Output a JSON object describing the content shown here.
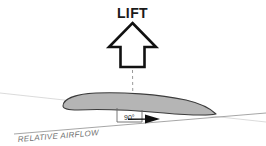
{
  "diagram": {
    "background_color": "#ffffff",
    "width": 266,
    "height": 146
  },
  "labels": {
    "lift": "LIFT",
    "angle": "90°",
    "relative_airflow": "RELATIVE AIRFLOW"
  },
  "colors": {
    "outline": "#111111",
    "airfoil_fill": "#b5b5b5",
    "airfoil_stroke": "#3a3a3a",
    "chord_line": "#cccccc",
    "airflow_line": "#8a8a8a",
    "dashed_line": "#9a9a9a",
    "angle_box": "#6a6a6a",
    "text_dark": "#1a1a1a",
    "text_gray": "#6e6e6e"
  },
  "elements": {
    "lift_arrow": {
      "name": "lift-arrow",
      "direction": "up",
      "style": "hollow-outlined",
      "stroke_width": 2.6
    },
    "dashed_centerline": {
      "name": "lift-centerline",
      "orientation": "vertical",
      "dash_pattern": "3 3"
    },
    "airfoil": {
      "name": "airfoil",
      "leading_edge": "rounded-left",
      "trailing_edge": "pointed-right"
    },
    "airflow_arrow": {
      "name": "airflow-arrowhead",
      "direction": "right",
      "style": "solid-filled"
    },
    "angle_marker": {
      "name": "right-angle-marker",
      "value": 90,
      "unit": "degrees"
    }
  }
}
